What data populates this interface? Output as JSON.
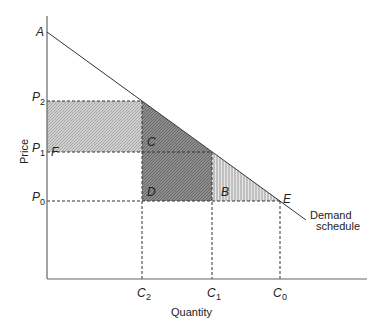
{
  "diagram": {
    "axes": {
      "y_label": "Price",
      "x_label": "Quantity"
    },
    "curve_label_line1": "Demand",
    "curve_label_line2": "schedule",
    "points": {
      "A": "A",
      "E": "E"
    },
    "price_ticks": [
      {
        "base": "P",
        "sub": "2"
      },
      {
        "base": "P",
        "sub": "1"
      },
      {
        "base": "P",
        "sub": "0"
      }
    ],
    "quantity_ticks": [
      {
        "base": "C",
        "sub": "2"
      },
      {
        "base": "C",
        "sub": "1"
      },
      {
        "base": "C",
        "sub": "0"
      }
    ],
    "regions": {
      "F": "F",
      "C": "C",
      "D": "D",
      "B": "B"
    },
    "colors": {
      "region_F": "#c4c4c4",
      "region_C": "#8a8a8a",
      "region_D": "#7a7a7a",
      "region_B_stripe": "#9a9a9a",
      "line": "#333333"
    }
  }
}
